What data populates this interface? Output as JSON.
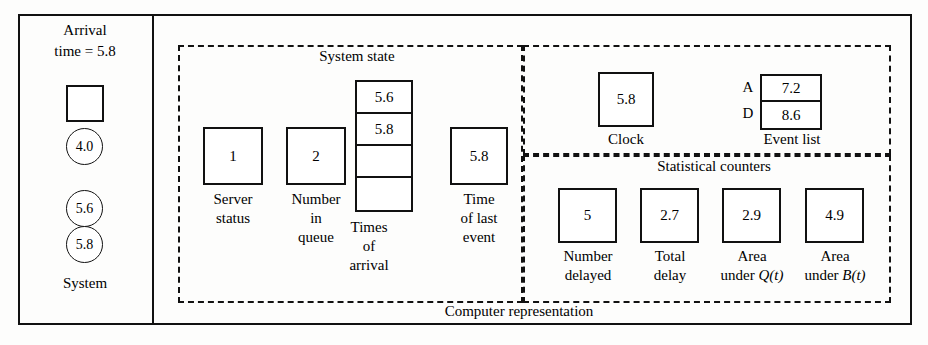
{
  "diagram": {
    "title_bottom": "Computer representation",
    "left_panel": {
      "title_line1": "Arrival",
      "title_line2": "time = 5.8",
      "server_box_value": "",
      "circles": [
        "4.0",
        "5.6",
        "5.8"
      ],
      "label": "System"
    },
    "system_state": {
      "region_title": "System state",
      "server_status": {
        "value": "1",
        "caption_line1": "Server",
        "caption_line2": "status"
      },
      "number_in_queue": {
        "value": "2",
        "caption_line1": "Number",
        "caption_line2": "in",
        "caption_line3": "queue"
      },
      "times_of_arrival": {
        "cells": [
          "5.6",
          "5.8",
          "",
          ""
        ],
        "caption_line1": "Times",
        "caption_line2": "of",
        "caption_line3": "arrival"
      },
      "time_of_last_event": {
        "value": "5.8",
        "caption_line1": "Time",
        "caption_line2": "of last",
        "caption_line3": "event"
      }
    },
    "clock_region": {
      "clock": {
        "value": "5.8",
        "caption": "Clock"
      },
      "event_list": {
        "caption": "Event list",
        "rows": [
          {
            "key": "A",
            "value": "7.2"
          },
          {
            "key": "D",
            "value": "8.6"
          }
        ]
      }
    },
    "statistical_counters": {
      "region_title": "Statistical counters",
      "items": [
        {
          "value": "5",
          "caption_line1": "Number",
          "caption_line2": "delayed",
          "caption_italic": ""
        },
        {
          "value": "2.7",
          "caption_line1": "Total",
          "caption_line2": "delay",
          "caption_italic": ""
        },
        {
          "value": "2.9",
          "caption_line1": "Area",
          "caption_line2": "under ",
          "caption_italic": "Q(t)"
        },
        {
          "value": "4.9",
          "caption_line1": "Area",
          "caption_line2": "under ",
          "caption_italic": "B(t)"
        }
      ]
    }
  }
}
